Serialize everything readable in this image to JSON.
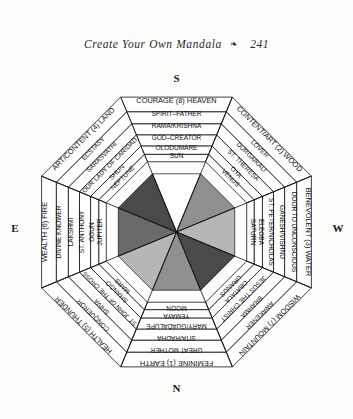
{
  "running_head": {
    "title": "Create Your Own Mandala",
    "ornament": "❧",
    "page_number": "241"
  },
  "compass": {
    "top": "S",
    "bottom": "N",
    "left": "E",
    "right": "W"
  },
  "figure": {
    "shape": "octagon",
    "ring_count": 6,
    "segment_count": 8,
    "colors": {
      "ink": "#111111",
      "band_fill": "#ffffff",
      "wedge_white": "#ffffff",
      "wedge_light": "#b6b6b6",
      "wedge_mid": "#909090",
      "wedge_dark": "#6a6a6a",
      "wedge_darkest": "#4a4a4a"
    },
    "segments": [
      {
        "position": "top",
        "angle_deg": 0,
        "wedge_color": "#ffffff",
        "rings": [
          "COURAGE (8) HEAVEN",
          "SPIRIT–FATHER",
          "RAMA/KRISHNA",
          "GOD–CREATOR",
          "OLODUMARE",
          "SUN"
        ]
      },
      {
        "position": "top-right",
        "angle_deg": 45,
        "wedge_color": "#909090",
        "rings": [
          "CONTENT/ART (2) WOOD",
          "LOVER",
          "DURGA/KALI",
          "ST. THERESA",
          "OYA",
          "VENUS"
        ]
      },
      {
        "position": "right",
        "angle_deg": 90,
        "wedge_color": "#b6b6b6",
        "rings": [
          "BENEVOLENT (3) WATER",
          "DOOR TO UNCONSCIOUS",
          "GANESH/VISHNU",
          "ST. PETER/NICHOLAS",
          "ELEGBA",
          "SATURN"
        ]
      },
      {
        "position": "bottom-right",
        "angle_deg": 135,
        "wedge_color": "#4a4a4a",
        "rings": [
          "WISDOM (7) MOUNTAIN",
          "AWAKENER",
          "BRAHMA",
          "JESUS THE CHRIST",
          "OBATALA",
          "URANUS"
        ]
      },
      {
        "position": "bottom",
        "angle_deg": 180,
        "wedge_color": "#909090",
        "rings": [
          "FEMININE (1) EARTH",
          "GREAT MOTHER",
          "SITA/RADHA",
          "MARY/GUADALUPE",
          "YEMAYA",
          "MOON"
        ]
      },
      {
        "position": "bottom-left",
        "angle_deg": 225,
        "wedge_color": "#b6b6b6",
        "rings": [
          "HEALTH (5) THUNDER",
          "CONQUEROR",
          "SHIVA",
          "ST. JOHN OF THE CROSS",
          "SHANGO",
          "MARS"
        ]
      },
      {
        "position": "left",
        "angle_deg": 270,
        "wedge_color": "#6a6a6a",
        "rings": [
          "WEALTH (6) FIRE",
          "DIVINE KNOWER",
          "LAKSHMI",
          "ST. ANTHONY",
          "OGUN",
          "JUPITER"
        ]
      },
      {
        "position": "top-left",
        "angle_deg": 315,
        "wedge_color": "#4a4a4a",
        "rings": [
          "ART/CONTENT (4) LAND",
          "ECSTASY",
          "SARASVATHI",
          "OUR LADY OF CARIDAD",
          "SHUN",
          "NEPTUNE"
        ]
      }
    ]
  },
  "caption": ""
}
